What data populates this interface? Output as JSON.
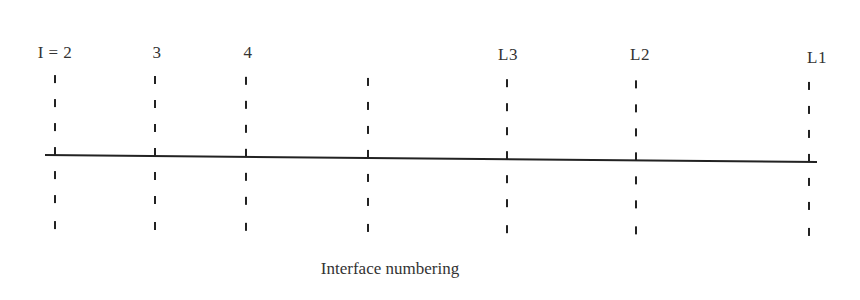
{
  "diagram": {
    "caption": "Interface numbering",
    "axis": {
      "x_start": 45,
      "y_start": 155,
      "x_end": 817,
      "y_end": 162,
      "color": "#222222"
    },
    "interfaces": [
      {
        "label": "I = 2",
        "x": 55,
        "label_x": 55,
        "label_y": 44
      },
      {
        "label": "3",
        "x": 155,
        "label_x": 157,
        "label_y": 44
      },
      {
        "label": "4",
        "x": 246,
        "label_x": 248,
        "label_y": 44
      },
      {
        "label": "",
        "x": 368,
        "label_x": 368,
        "label_y": 44
      },
      {
        "label": "L3",
        "x": 507,
        "label_x": 508,
        "label_y": 46
      },
      {
        "label": "L2",
        "x": 636,
        "label_x": 640,
        "label_y": 46
      },
      {
        "label": "L1",
        "x": 809,
        "label_x": 817,
        "label_y": 49
      }
    ],
    "dash_color": "#222222"
  }
}
